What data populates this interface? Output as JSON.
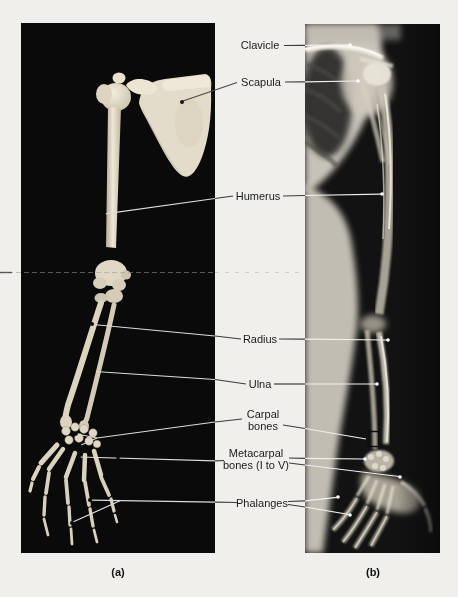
{
  "figure": {
    "type": "labeled-anatomy-figure",
    "labels": {
      "clavicle": "Clavicle",
      "scapula": "Scapula",
      "humerus": "Humerus",
      "radius": "Radius",
      "ulna": "Ulna",
      "carpal_line1": "Carpal",
      "carpal_line2": "bones",
      "metacarpal_line1": "Metacarpal",
      "metacarpal_line2": "bones (I to V)",
      "phalanges": "Phalanges"
    },
    "captions": {
      "a": "(a)",
      "b": "(b)"
    },
    "panels": [
      {
        "id": "a",
        "description": "photograph of right upper limb bones on black background"
      },
      {
        "id": "b",
        "description": "radiograph (X-ray) of the upper limb"
      }
    ],
    "colors": {
      "page_background": "#f0efeb",
      "photo_background": "#0a0a0a",
      "bone": "#e2dbc8",
      "label_text": "#1b1b1b",
      "leader_line_light": "#e6e6e6",
      "leader_line_dark": "#3c3c3c"
    }
  }
}
